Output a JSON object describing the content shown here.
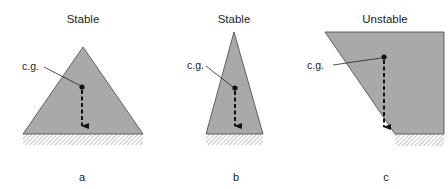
{
  "diagram": {
    "type": "stability-of-shapes",
    "colors": {
      "fill": "#a9a9a9",
      "outline": "#444444",
      "arrow": "#111111",
      "hatch": "#999999"
    },
    "panels": [
      {
        "id": "a",
        "title": "Stable",
        "cg_label": "c.g.",
        "caption": "a"
      },
      {
        "id": "b",
        "title": "Stable",
        "cg_label": "c.g.",
        "caption": "b"
      },
      {
        "id": "c",
        "title": "Unstable",
        "cg_label": "c.g.",
        "caption": "c"
      }
    ]
  }
}
